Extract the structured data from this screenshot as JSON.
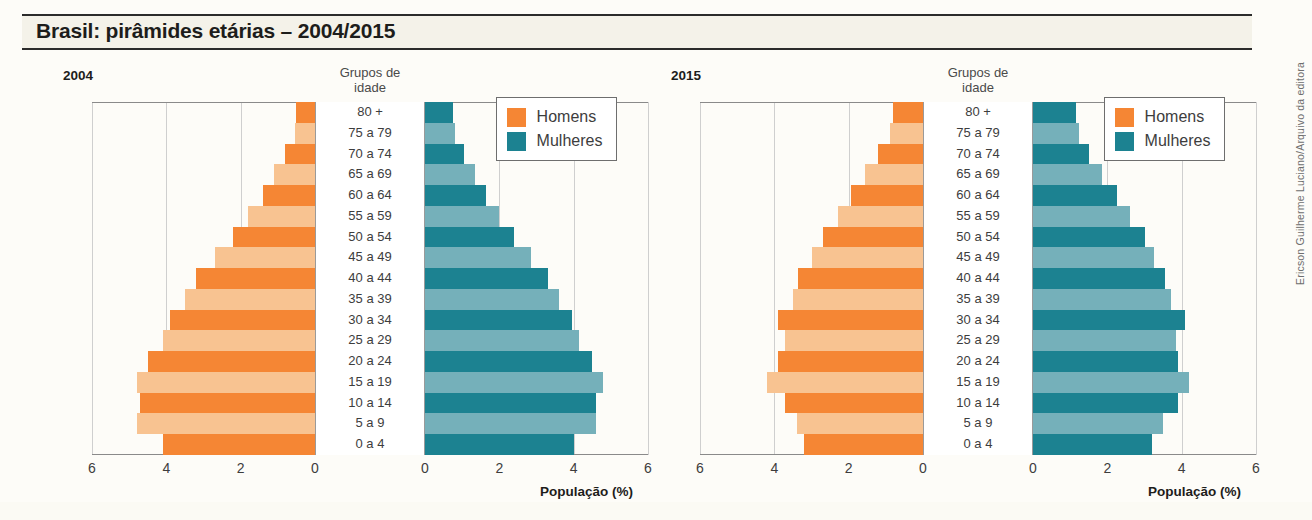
{
  "title": "Brasil: pirâmides etárias – 2004/2015",
  "credit": "Ericson Guilherme Luciano/Arquivo da editora",
  "colors": {
    "men_dark": "#f58634",
    "men_light": "#f8c391",
    "women_dark": "#1c8291",
    "women_light": "#75b0ba",
    "title_band": "#f4f2e9",
    "grid": "#cfcfcf",
    "axis": "#8a8a8a"
  },
  "legend": {
    "men_label": "Homens",
    "women_label": "Mulheres"
  },
  "axis": {
    "group_header_line1": "Grupos de",
    "group_header_line2": "idade",
    "x_title": "População (%)",
    "x_ticks_left": [
      "6",
      "4",
      "2",
      "0"
    ],
    "x_ticks_right": [
      "0",
      "2",
      "4",
      "6"
    ],
    "x_max": 6
  },
  "age_groups": [
    "80 +",
    "75 a 79",
    "70 a 74",
    "65 a 69",
    "60 a 64",
    "55 a 59",
    "50 a 54",
    "45 a 49",
    "40 a 44",
    "35 a 39",
    "30 a 34",
    "25 a 29",
    "20 a 24",
    "15 a 19",
    "10 a 14",
    "5 a 9",
    "0 a 4"
  ],
  "panels": [
    {
      "year": "2004"
    },
    {
      "year": "2015"
    }
  ],
  "chart_data": {
    "type": "bar",
    "subtype": "population-pyramid",
    "title": "Brasil: pirâmides etárias – 2004/2015",
    "xlabel": "População (%)",
    "ylabel": "Grupos de idade",
    "xlim": [
      0,
      6
    ],
    "grid": true,
    "legend_position": "top-right",
    "categories": [
      "80 +",
      "75 a 79",
      "70 a 74",
      "65 a 69",
      "60 a 64",
      "55 a 59",
      "50 a 54",
      "45 a 49",
      "40 a 44",
      "35 a 39",
      "30 a 34",
      "25 a 29",
      "20 a 24",
      "15 a 19",
      "10 a 14",
      "5 a 9",
      "0 a 4"
    ],
    "panels": [
      {
        "year": "2004",
        "series": [
          {
            "name": "Homens",
            "side": "left",
            "values": [
              0.5,
              0.55,
              0.8,
              1.1,
              1.4,
              1.8,
              2.2,
              2.7,
              3.2,
              3.5,
              3.9,
              4.1,
              4.5,
              4.8,
              4.7,
              4.8,
              4.1
            ]
          },
          {
            "name": "Mulheres",
            "side": "right",
            "values": [
              0.75,
              0.8,
              1.05,
              1.35,
              1.65,
              2.0,
              2.4,
              2.85,
              3.3,
              3.6,
              3.95,
              4.15,
              4.5,
              4.8,
              4.6,
              4.6,
              4.0
            ]
          }
        ]
      },
      {
        "year": "2015",
        "series": [
          {
            "name": "Homens",
            "side": "left",
            "values": [
              0.8,
              0.9,
              1.2,
              1.55,
              1.95,
              2.3,
              2.7,
              3.0,
              3.35,
              3.5,
              3.9,
              3.7,
              3.9,
              4.2,
              3.7,
              3.4,
              3.2
            ]
          },
          {
            "name": "Mulheres",
            "side": "right",
            "values": [
              1.15,
              1.25,
              1.5,
              1.85,
              2.25,
              2.6,
              3.0,
              3.25,
              3.55,
              3.7,
              4.1,
              3.85,
              3.9,
              4.2,
              3.9,
              3.5,
              3.2
            ]
          }
        ]
      }
    ]
  }
}
